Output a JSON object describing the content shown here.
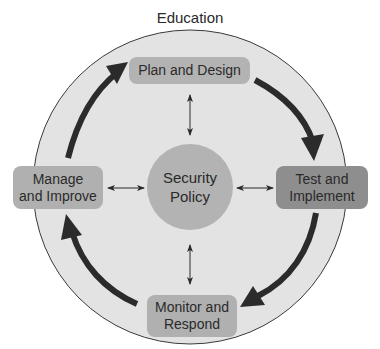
{
  "diagram": {
    "title": "Education",
    "center": {
      "line1": "Security",
      "line2": "Policy"
    },
    "nodes": [
      {
        "id": "plan",
        "line1": "Plan and Design",
        "line2": ""
      },
      {
        "id": "test",
        "line1": "Test and",
        "line2": "Implement"
      },
      {
        "id": "monitor",
        "line1": "Monitor and",
        "line2": "Respond"
      },
      {
        "id": "manage",
        "line1": "Manage",
        "line2": "and Improve"
      }
    ],
    "cycle_order": [
      "Plan and Design",
      "Test and Implement",
      "Monitor and Respond",
      "Manage and Improve"
    ],
    "cycle_direction": "clockwise",
    "connections": [
      {
        "from": "Security Policy",
        "to": "Plan and Design",
        "type": "bidirectional"
      },
      {
        "from": "Security Policy",
        "to": "Test and Implement",
        "type": "bidirectional"
      },
      {
        "from": "Security Policy",
        "to": "Monitor and Respond",
        "type": "bidirectional"
      },
      {
        "from": "Security Policy",
        "to": "Manage and Improve",
        "type": "bidirectional"
      }
    ],
    "colors": {
      "outer_circle_fill": "#e3e3e3",
      "outer_circle_stroke": "#3a3a3a",
      "node_fill": "#b3b3b3",
      "highlight_node_fill": "#8e8e8e",
      "cycle_arrow": "#2b2b2b",
      "text": "#2a2a2a"
    }
  }
}
